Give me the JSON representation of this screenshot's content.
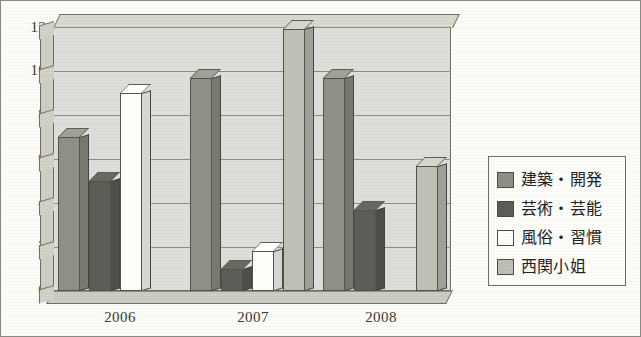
{
  "chart_data": {
    "type": "bar",
    "title": "",
    "subtitle": "",
    "xlabel": "",
    "ylabel": "",
    "categories": [
      "2006",
      "2007",
      "2008"
    ],
    "ylim": [
      0,
      12
    ],
    "yticks": [
      0,
      2,
      4,
      6,
      8,
      10,
      12
    ],
    "grid": true,
    "legend_position": "right",
    "three_d": true,
    "series": [
      {
        "name": "建築・開発",
        "color": "#8f8f87",
        "values": [
          7,
          9.7,
          9.7
        ]
      },
      {
        "name": "芸術・芸能",
        "color": "#5d5d57",
        "values": [
          5,
          1,
          3.7
        ]
      },
      {
        "name": "風俗・習慣",
        "color": "#fdfdfa",
        "values": [
          9,
          1.8,
          0
        ]
      },
      {
        "name": "西関小姐",
        "color": "#bfbfb5",
        "values": [
          0,
          11.9,
          5.7
        ]
      }
    ]
  },
  "legend": {
    "items": [
      {
        "label": "建築・開発",
        "swatch": "#8f8f87"
      },
      {
        "label": "芸術・芸能",
        "swatch": "#5d5d57"
      },
      {
        "label": "風俗・習慣",
        "swatch": "#fdfdfa"
      },
      {
        "label": "西関小姐",
        "swatch": "#bfbfb5"
      }
    ]
  },
  "axis": {
    "y_ticks": [
      "12",
      "10",
      "8",
      "6",
      "4",
      "2",
      "0"
    ],
    "x_ticks": [
      "2006",
      "2007",
      "2008"
    ]
  },
  "colors": {
    "plot_background": "#dededa",
    "frame": "#6f6f67",
    "gridline": "#8d8d84",
    "page_background": "#fcfcf8"
  }
}
